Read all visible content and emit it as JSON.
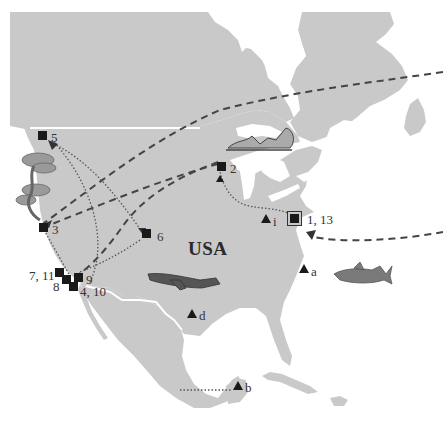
{
  "map": {
    "region": "North America",
    "colors": {
      "land": "#c9c9c9",
      "water": "#ffffff",
      "border": "#ffffff",
      "marker": "#1a1a1a",
      "route": "#444444"
    },
    "country_labels": [
      {
        "id": "usa",
        "text": "USA"
      }
    ],
    "sites": [
      {
        "id": "1-13",
        "label": "1, 13",
        "shape": "boxed-square"
      },
      {
        "id": "2",
        "label": "2",
        "shape": "square"
      },
      {
        "id": "3",
        "label": "3",
        "shape": "square"
      },
      {
        "id": "4-10",
        "label": "4, 10",
        "shape": "square"
      },
      {
        "id": "5",
        "label": "5",
        "shape": "square"
      },
      {
        "id": "6",
        "label": "6",
        "shape": "square"
      },
      {
        "id": "7-11",
        "label": "7, 11",
        "shape": "square"
      },
      {
        "id": "8",
        "label": "8",
        "shape": "square"
      },
      {
        "id": "9",
        "label": "9",
        "shape": "square"
      }
    ],
    "triangles": [
      {
        "id": "a",
        "label": "a"
      },
      {
        "id": "b",
        "label": "b"
      },
      {
        "id": "d",
        "label": "d"
      },
      {
        "id": "i",
        "label": "i"
      }
    ],
    "routes": [
      {
        "style": "dashed",
        "description": "from east (off-map) across Canada to site 3"
      },
      {
        "style": "dashed",
        "description": "from site 2 to site 3 region / southwest"
      },
      {
        "style": "dashed",
        "description": "from Atlantic (off-map) to site 1, 13"
      },
      {
        "style": "dotted",
        "description": "between site 5 and site 6"
      },
      {
        "style": "dotted",
        "description": "site 3 to sites 7-9"
      },
      {
        "style": "dotted",
        "description": "site 6 to site 9"
      },
      {
        "style": "dotted",
        "description": "site 4,10 to site 5"
      },
      {
        "style": "dotted",
        "description": "site 1,13 to site 2"
      },
      {
        "style": "dotted",
        "description": "site b westward"
      }
    ],
    "illustrations": [
      {
        "id": "tree",
        "name": "pine-tree-illustration"
      },
      {
        "id": "canoe",
        "name": "canoe-illustration"
      },
      {
        "id": "airplane",
        "name": "airplane-illustration"
      },
      {
        "id": "shark",
        "name": "shark-illustration"
      }
    ]
  }
}
